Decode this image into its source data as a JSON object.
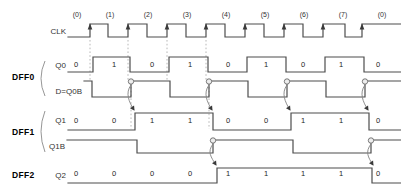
{
  "diagram_type": "digital-timing-diagram",
  "canvas": {
    "width": 401,
    "height": 194
  },
  "colors": {
    "background": "#ffffff",
    "wave": "#4d4d4d",
    "dashed": "#b0b0b0",
    "cause_arrow": "#828282",
    "arrowhead": "#3a3a3a",
    "circle_fill": "#ededed",
    "circle_stroke": "#6a6a6a",
    "digit": "#222222",
    "period_text": "#333333",
    "brace": "#8a8a8a"
  },
  "period_labels": {
    "y": 17,
    "items": [
      {
        "text": "(0)",
        "x": 77
      },
      {
        "text": "(1)",
        "x": 110
      },
      {
        "text": "(2)",
        "x": 148
      },
      {
        "text": "(3)",
        "x": 187
      },
      {
        "text": "(4)",
        "x": 226
      },
      {
        "text": "(5)",
        "x": 265
      },
      {
        "text": "(6)",
        "x": 304
      },
      {
        "text": "(7)",
        "x": 343
      },
      {
        "text": "(0)",
        "x": 382
      }
    ]
  },
  "value_columns_x": [
    76,
    114,
    152,
    190,
    228,
    266,
    303,
    341,
    378
  ],
  "groups": [
    {
      "label": "DFF0",
      "brace": {
        "x": 45,
        "y1": 61,
        "y2": 96
      }
    },
    {
      "label": "DFF1",
      "brace": {
        "x": 45,
        "y1": 111,
        "y2": 152
      }
    },
    {
      "label": "DFF2"
    }
  ],
  "signals": [
    {
      "id": "clk",
      "label": "CLK",
      "high_y": 24,
      "low_y": 37,
      "start_x": 68,
      "end_x": 401,
      "initial": 0,
      "toggles": [
        90,
        108,
        128,
        147,
        167,
        186,
        206,
        225,
        245,
        264,
        284,
        303,
        323,
        345,
        362
      ],
      "edge_arrows": [
        90,
        128,
        167,
        206,
        245,
        284,
        323,
        362
      ]
    },
    {
      "id": "q0",
      "label": "Q0",
      "high_y": 57,
      "low_y": 72,
      "start_x": 68,
      "end_x": 401,
      "initial": 0,
      "toggles": [
        93,
        130,
        169,
        208,
        247,
        286,
        325,
        364
      ],
      "values": {
        "y": 64,
        "digits": [
          "0",
          "1",
          "0",
          "1",
          "0",
          "1",
          "0",
          "1",
          "0"
        ]
      }
    },
    {
      "id": "d-q0b",
      "label": "D=Q0B",
      "high_y": 81,
      "low_y": 97,
      "start_x": 84,
      "end_x": 401,
      "initial": 1,
      "toggles": [
        92,
        131,
        170,
        209,
        248,
        287,
        326,
        365
      ],
      "clock_circles": [
        131,
        209,
        287,
        365
      ]
    },
    {
      "id": "q1",
      "label": "Q1",
      "high_y": 113,
      "low_y": 130,
      "start_x": 68,
      "end_x": 401,
      "initial": 0,
      "toggles": [
        135,
        213,
        291,
        369
      ],
      "values": {
        "y": 120,
        "digits": [
          "0",
          "0",
          "1",
          "1",
          "0",
          "0",
          "1",
          "1",
          "0"
        ]
      }
    },
    {
      "id": "q1b",
      "label": "Q1B",
      "high_y": 140,
      "low_y": 153,
      "start_x": 67,
      "end_x": 401,
      "initial": 1,
      "toggles": [
        137,
        213,
        293,
        371
      ],
      "clock_circles": [
        213,
        371
      ]
    },
    {
      "id": "q2",
      "label": "Q2",
      "high_y": 168,
      "low_y": 183,
      "start_x": 68,
      "end_x": 401,
      "initial": 0,
      "toggles": [
        217,
        372
      ],
      "values": {
        "y": 173,
        "digits": [
          "0",
          "0",
          "0",
          "0",
          "1",
          "1",
          "1",
          "1",
          "0"
        ]
      }
    }
  ],
  "dashed_lines": [
    {
      "x": 90,
      "y1": 40,
      "y2": 80
    },
    {
      "x": 128,
      "y1": 40,
      "y2": 80
    },
    {
      "x": 167,
      "y1": 40,
      "y2": 80
    },
    {
      "x": 206,
      "y1": 40,
      "y2": 80
    },
    {
      "x": 131,
      "y1": 87,
      "y2": 129
    },
    {
      "x": 209,
      "y1": 87,
      "y2": 129
    }
  ],
  "cause_arrows": [
    {
      "x1": 131,
      "y1": 85,
      "x2": 134,
      "y2": 110
    },
    {
      "x1": 209,
      "y1": 85,
      "x2": 212,
      "y2": 110
    },
    {
      "x1": 287,
      "y1": 85,
      "x2": 290,
      "y2": 110
    },
    {
      "x1": 365,
      "y1": 85,
      "x2": 368,
      "y2": 110
    },
    {
      "x1": 213,
      "y1": 144,
      "x2": 216,
      "y2": 165
    },
    {
      "x1": 371,
      "y1": 144,
      "x2": 373,
      "y2": 165
    }
  ]
}
